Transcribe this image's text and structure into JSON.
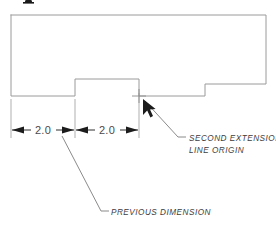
{
  "figure": {
    "background_color": "#ffffff",
    "outline_color": "#9a9a9a",
    "dimension_color": "#2f2f2f",
    "extension_color": "#a6a6a6",
    "leader_color": "#7d7d7d",
    "text_color": "#3d3d3d"
  },
  "dimensions": [
    {
      "id": "dim-left",
      "label": "2.0",
      "value": 2.0,
      "x_start": 11,
      "x_end": 75,
      "baseline_y": 130
    },
    {
      "id": "dim-right",
      "label": "2.0",
      "value": 2.0,
      "x_start": 75,
      "x_end": 139,
      "baseline_y": 130
    }
  ],
  "extension_lines": [
    {
      "id": "ext-1",
      "x": 11,
      "y_top": 99,
      "y_bottom": 138
    },
    {
      "id": "ext-2",
      "x": 75,
      "y_top": 99,
      "y_bottom": 138
    },
    {
      "id": "ext-3",
      "x": 139,
      "y_top": 93,
      "y_bottom": 138
    }
  ],
  "callouts": {
    "second_extension": {
      "line_1": "SECOND EXTENSION",
      "line_2": "LINE ORIGIN",
      "text_x": 189,
      "text_y_1": 141,
      "text_y_2": 153
    },
    "previous_dimension": {
      "line_1": "PREVIOUS DIMENSION",
      "text_x": 111,
      "text_y_1": 215
    }
  },
  "marker": {
    "name": "second-extension-line-origin-point",
    "x": 139,
    "y": 96,
    "arm": 7
  },
  "cursor": {
    "name": "pick-cursor",
    "tip_x": 143,
    "tip_y": 99
  },
  "profile": {
    "description": "Rectangular body with a raised central notch and a stepped right shoulder",
    "points": "11,15 266,15 266,84 205,84 205,96 139,96 139,79 75,79 75,96 11,96 11,15"
  }
}
